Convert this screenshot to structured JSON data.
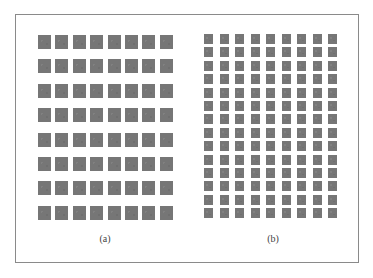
{
  "figure": {
    "panels": [
      {
        "id": "a",
        "label": "(a)",
        "rows": 8,
        "cols": 8,
        "origin": [
          38,
          35
        ],
        "square_w": 13,
        "square_h": 14,
        "pitch_x": 17.4,
        "pitch_y": 24.4,
        "label_x": 105,
        "label_y": 233
      },
      {
        "id": "b",
        "label": "(b)",
        "rows": 14,
        "cols": 9,
        "origin": [
          204,
          34
        ],
        "square_w": 9,
        "square_h": 10,
        "pitch_x": 15.5,
        "pitch_y": 13.4,
        "label_x": 273,
        "label_y": 233
      }
    ],
    "colors": {
      "square": "#767676",
      "border": "#8a8a8a",
      "background": "#ffffff"
    }
  }
}
